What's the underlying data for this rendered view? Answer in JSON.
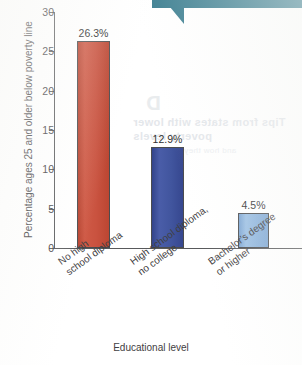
{
  "chart_data": {
    "type": "bar",
    "title": "",
    "subtitle": "",
    "xlabel": "Educational level",
    "ylabel": "Percentage ages 25 and older below poverty line",
    "categories": [
      "No high school diploma",
      "High school diploma, no college",
      "Bachelor's degree or higher"
    ],
    "category_lines": [
      [
        "No high",
        "school diploma"
      ],
      [
        "High school diploma,",
        "no college"
      ],
      [
        "Bachelor's degree",
        "or higher"
      ]
    ],
    "values": [
      26.3,
      12.9,
      4.5
    ],
    "value_labels": [
      "26.3%",
      "12.9%",
      "4.5%"
    ],
    "colors": [
      "#c9523f",
      "#41559e",
      "#8cb3dc"
    ],
    "ylim": [
      0,
      30
    ],
    "ytick_values": [
      0,
      5,
      10,
      15,
      20,
      25,
      30
    ],
    "ytick_labels": [
      "0",
      "5",
      "10",
      "15",
      "20",
      "25",
      "30"
    ],
    "grid": false,
    "legend": false,
    "legend_position": "none"
  },
  "decorations": {
    "callout_color": "#3d7f91",
    "axis_color": "#58595b",
    "text_color": "#3f4042"
  },
  "bleed_through": {
    "line1": "D",
    "line2": "Tips from states with lower",
    "line3": "poverty levels",
    "line4": "and how they manage"
  }
}
